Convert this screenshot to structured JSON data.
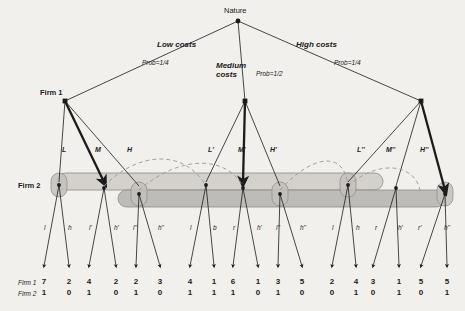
{
  "diagram": {
    "title_node": "Nature",
    "player1_label": "Firm 1",
    "player2_label": "Firm 2",
    "payoff_row1_label": "Firm 1",
    "payoff_row2_label": "Firm 2",
    "colors": {
      "background": "#f2f0ed",
      "line": "#1b1b1b",
      "infoset_fill": "#b9b7b2",
      "infoset_stroke": "#8c8a86",
      "dashed": "#9a9894"
    }
  },
  "nature_branches": [
    {
      "id": "low",
      "cost_label": "Low costs",
      "prob_label": "Prob=1/4"
    },
    {
      "id": "medium",
      "cost_label": "Medium costs",
      "prob_label": "Prob=1/2"
    },
    {
      "id": "high",
      "cost_label": "High costs",
      "prob_label": "Prob=1/4"
    }
  ],
  "firm1_actions": [
    {
      "branch": "low",
      "labels": [
        "L",
        "M",
        "H"
      ],
      "bold_index": 1
    },
    {
      "branch": "medium",
      "labels": [
        "L'",
        "M'",
        "H'"
      ],
      "bold_index": 1
    },
    {
      "branch": "high",
      "labels": [
        "L''",
        "M''",
        "H''"
      ],
      "bold_index": 2
    }
  ],
  "firm2_actions": [
    [
      "l",
      "h",
      "l'",
      "h'",
      "l''",
      "h''"
    ],
    [
      "l",
      "b",
      "r",
      "h'",
      "l''",
      "h''"
    ],
    [
      "l",
      "h",
      "r",
      "h'",
      "r'",
      "h''"
    ]
  ],
  "payoffs": {
    "firm1": [
      7,
      2,
      4,
      2,
      2,
      3,
      4,
      1,
      6,
      1,
      3,
      5,
      2,
      4,
      3,
      1,
      5,
      5
    ],
    "firm2": [
      1,
      0,
      1,
      0,
      1,
      0,
      1,
      1,
      1,
      0,
      1,
      0,
      0,
      1,
      0,
      1,
      0,
      1
    ]
  }
}
